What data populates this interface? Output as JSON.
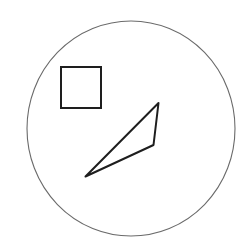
{
  "canvas": {
    "width": 239,
    "height": 240,
    "background": "#ffffff"
  },
  "shapes": {
    "circle": {
      "cx": 131,
      "cy": 128.5,
      "rx": 104,
      "ry": 107.5,
      "stroke": "#6a6a6a",
      "stroke_width": 1.1
    },
    "square": {
      "x": 61,
      "y": 67,
      "width": 40,
      "height": 41,
      "stroke": "#1e1e1e",
      "stroke_width": 2
    },
    "triangle": {
      "points": "158.5,103 153.5,145 85.5,176.5",
      "stroke": "#1e1e1e",
      "stroke_width": 2
    }
  }
}
